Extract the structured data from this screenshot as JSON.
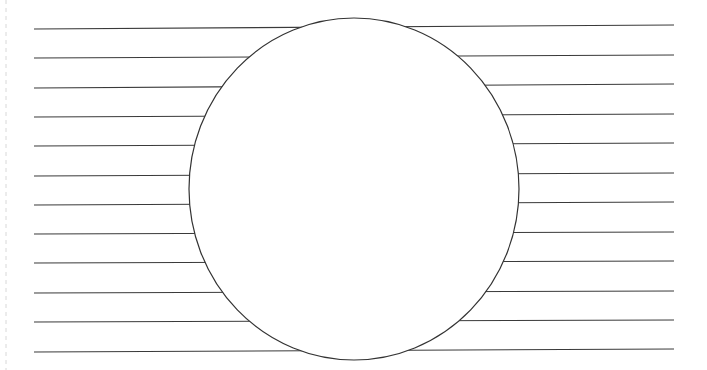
{
  "diagram": {
    "colors": {
      "background": "#ffffff",
      "line": "#3a3a3a",
      "circle_stroke": "#333333",
      "circle_fill": "#ffffff",
      "edge_guide": "#d8d8d8"
    },
    "lines": [
      {
        "x1": 34,
        "y1": 29,
        "x2": 674,
        "y2": 25
      },
      {
        "x1": 34,
        "y1": 58,
        "x2": 674,
        "y2": 55
      },
      {
        "x1": 34,
        "y1": 88,
        "x2": 674,
        "y2": 84
      },
      {
        "x1": 34,
        "y1": 117,
        "x2": 674,
        "y2": 114
      },
      {
        "x1": 34,
        "y1": 146,
        "x2": 674,
        "y2": 143
      },
      {
        "x1": 34,
        "y1": 176,
        "x2": 674,
        "y2": 173
      },
      {
        "x1": 34,
        "y1": 205,
        "x2": 674,
        "y2": 202
      },
      {
        "x1": 34,
        "y1": 234,
        "x2": 674,
        "y2": 232
      },
      {
        "x1": 34,
        "y1": 263,
        "x2": 674,
        "y2": 261
      },
      {
        "x1": 34,
        "y1": 293,
        "x2": 674,
        "y2": 291
      },
      {
        "x1": 34,
        "y1": 322,
        "x2": 674,
        "y2": 320
      },
      {
        "x1": 34,
        "y1": 352,
        "x2": 674,
        "y2": 349
      }
    ],
    "circle": {
      "cx": 354,
      "cy": 189,
      "rx": 165,
      "ry": 171
    },
    "left_edge_guide": {
      "x": 6,
      "y1": 0,
      "y2": 370
    }
  }
}
